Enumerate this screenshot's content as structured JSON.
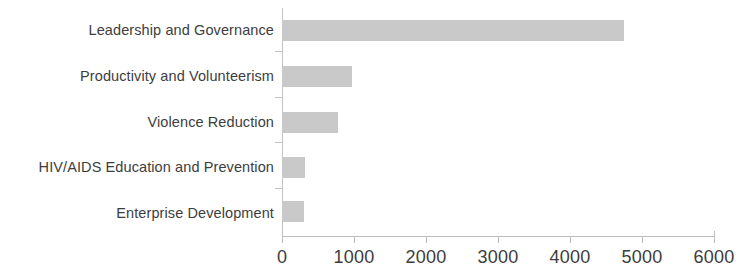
{
  "chart_data": {
    "type": "bar",
    "orientation": "horizontal",
    "title": "",
    "subtitle": "",
    "xlabel": "",
    "ylabel": "",
    "categories": [
      "Leadership and Governance",
      "Productivity and Volunteerism",
      "Violence Reduction",
      "HIV/AIDS Education and Prevention",
      "Enterprise Development"
    ],
    "values": [
      4750,
      970,
      780,
      320,
      310
    ],
    "xlim": [
      0,
      6000
    ],
    "xticks": [
      0,
      1000,
      2000,
      3000,
      4000,
      5000,
      6000
    ],
    "xtick_labels": [
      "0",
      "1000",
      "2000",
      "3000",
      "4000",
      "5000",
      "6000"
    ],
    "grid": false,
    "legend": null,
    "bar_color": "#c9c9c9",
    "text_color": "#3d3d3d",
    "axis_color": "#bdbdbd"
  }
}
